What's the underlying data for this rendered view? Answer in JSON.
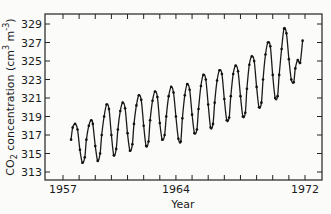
{
  "chart_data": {
    "type": "line",
    "title": "",
    "xlabel": "Year",
    "ylabel": "CO2 concentration (cm^3 m^-3)",
    "ylabel_parts": {
      "main": "CO",
      "sub": "2",
      "rest": " concentration (cm",
      "sup1": "3",
      "mid": " m",
      "sup2": "-3",
      "end": ")"
    },
    "xlim": [
      1956.9,
      1972.9
    ],
    "ylim": [
      312,
      330.2
    ],
    "x_ticks_labeled": [
      1957,
      1964,
      1972
    ],
    "x_minor_ticks_every": 1,
    "y_ticks": [
      313,
      315,
      317,
      319,
      321,
      323,
      325,
      327,
      329
    ],
    "grid": false,
    "legend": null,
    "series": [
      {
        "name": "Monthly CO2 (Mauna Loa)",
        "style": "line-with-markers",
        "x": [
          1957.5,
          1957.6,
          1957.75,
          1957.9,
          1958.05,
          1958.2,
          1958.35,
          1958.45,
          1958.6,
          1958.75,
          1958.85,
          1959.0,
          1959.15,
          1959.3,
          1959.4,
          1959.55,
          1959.7,
          1959.85,
          1960.0,
          1960.15,
          1960.3,
          1960.4,
          1960.55,
          1960.7,
          1960.85,
          1961.0,
          1961.15,
          1961.3,
          1961.4,
          1961.55,
          1961.7,
          1961.85,
          1962.0,
          1962.15,
          1962.3,
          1962.4,
          1962.55,
          1962.7,
          1962.85,
          1963.0,
          1963.15,
          1963.3,
          1963.4,
          1963.55,
          1963.7,
          1963.85,
          1964.0,
          1964.15,
          1964.3,
          1964.4,
          1964.55,
          1964.7,
          1964.85,
          1965.0,
          1965.15,
          1965.3,
          1965.4,
          1965.55,
          1965.7,
          1965.85,
          1966.0,
          1966.15,
          1966.3,
          1966.4,
          1966.55,
          1966.7,
          1966.85,
          1967.0,
          1967.15,
          1967.3,
          1967.4,
          1967.55,
          1967.7,
          1967.85,
          1968.0,
          1968.15,
          1968.3,
          1968.4,
          1968.55,
          1968.7,
          1968.85,
          1969.0,
          1969.15,
          1969.3,
          1969.4,
          1969.55,
          1969.7,
          1969.85,
          1970.0,
          1970.15,
          1970.3,
          1970.4,
          1970.55,
          1970.7,
          1970.85,
          1971.0,
          1971.15,
          1971.3,
          1971.4,
          1971.55,
          1971.7,
          1971.85
        ],
        "y": [
          316.5,
          317.8,
          318.2,
          317.6,
          315.4,
          314.0,
          314.6,
          316.5,
          318.0,
          318.6,
          318.2,
          315.8,
          314.2,
          315.0,
          317.0,
          319.0,
          320.3,
          319.8,
          317.0,
          314.8,
          315.5,
          317.6,
          319.6,
          320.5,
          319.9,
          317.2,
          315.3,
          316.0,
          318.2,
          320.2,
          321.3,
          320.8,
          318.0,
          315.8,
          316.3,
          318.6,
          320.7,
          321.7,
          321.1,
          318.3,
          316.5,
          317.0,
          319.0,
          321.2,
          322.2,
          321.6,
          319.0,
          316.6,
          316.3,
          318.8,
          321.3,
          322.5,
          321.9,
          319.2,
          317.2,
          317.6,
          319.8,
          322.3,
          323.5,
          323.0,
          320.3,
          317.8,
          318.2,
          320.5,
          322.9,
          324.0,
          323.6,
          320.9,
          318.6,
          318.9,
          321.2,
          323.6,
          324.5,
          323.9,
          321.2,
          319.0,
          319.4,
          322.0,
          324.6,
          325.5,
          325.0,
          322.2,
          320.0,
          320.5,
          323.0,
          325.7,
          327.0,
          326.6,
          323.5,
          321.0,
          321.2,
          323.5,
          326.3,
          328.5,
          328.0,
          325.2,
          323.0,
          322.7,
          324.2,
          325.1,
          324.8,
          327.2
        ]
      }
    ]
  },
  "axes": {
    "x_title": "Year",
    "x_labels": [
      "1957",
      "1964",
      "1972"
    ],
    "y_labels": [
      "313",
      "315",
      "317",
      "319",
      "321",
      "323",
      "325",
      "327",
      "329"
    ]
  }
}
